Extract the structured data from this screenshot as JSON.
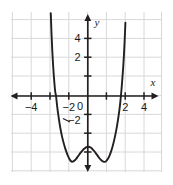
{
  "figure": {
    "background_color": "#ffffff",
    "plot_area": {
      "left": 11,
      "top": 12,
      "right": 162,
      "bottom": 172
    },
    "grid_color": "#d5d5d5",
    "axis_color": "#231f20",
    "curve_color": "#231f20",
    "origin_px": {
      "x": 88,
      "y": 96
    },
    "unit_px": 18.8
  },
  "labels": {
    "x_axis_name": "x",
    "y_axis_name": "y",
    "origin_label": "0"
  },
  "chart_data": {
    "type": "line",
    "title": "",
    "xlabel": "x",
    "ylabel": "y",
    "grid": true,
    "legend": "none",
    "xlim": [
      -5,
      4
    ],
    "ylim": [
      -4.5,
      5
    ],
    "xticks": [
      -4,
      -2,
      2,
      4
    ],
    "xtick_labels": [
      "−4",
      "−2",
      "2",
      "4"
    ],
    "yticks": [
      2,
      4,
      -2
    ],
    "ytick_labels": [
      "2",
      "4",
      "−2"
    ],
    "x_minor_tick_step": 1,
    "y_minor_tick_step": 1,
    "roots": [
      -1.7,
      1.75
    ],
    "minima": [
      {
        "x": -0.85,
        "y": -3.5
      },
      {
        "x": 0.9,
        "y": -3.5
      }
    ],
    "local_maximum": {
      "x": 0.02,
      "y": -2.7
    },
    "series": [
      {
        "name": "quartic",
        "points": [
          [
            -2.02,
            5.6
          ],
          [
            -1.98,
            4.4
          ],
          [
            -1.94,
            3.3
          ],
          [
            -1.9,
            2.4
          ],
          [
            -1.86,
            1.7
          ],
          [
            -1.82,
            1.1
          ],
          [
            -1.78,
            0.6
          ],
          [
            -1.74,
            0.2
          ],
          [
            -1.7,
            0.0
          ],
          [
            -1.64,
            -0.55
          ],
          [
            -1.58,
            -1.0
          ],
          [
            -1.52,
            -1.42
          ],
          [
            -1.45,
            -1.82
          ],
          [
            -1.38,
            -2.16
          ],
          [
            -1.3,
            -2.48
          ],
          [
            -1.22,
            -2.76
          ],
          [
            -1.14,
            -3.0
          ],
          [
            -1.06,
            -3.2
          ],
          [
            -0.98,
            -3.36
          ],
          [
            -0.9,
            -3.47
          ],
          [
            -0.85,
            -3.5
          ],
          [
            -0.78,
            -3.48
          ],
          [
            -0.7,
            -3.42
          ],
          [
            -0.62,
            -3.33
          ],
          [
            -0.54,
            -3.22
          ],
          [
            -0.46,
            -3.11
          ],
          [
            -0.38,
            -3.0
          ],
          [
            -0.3,
            -2.9
          ],
          [
            -0.22,
            -2.82
          ],
          [
            -0.14,
            -2.76
          ],
          [
            -0.06,
            -2.71
          ],
          [
            0.02,
            -2.7
          ],
          [
            0.1,
            -2.72
          ],
          [
            0.18,
            -2.77
          ],
          [
            0.26,
            -2.85
          ],
          [
            0.34,
            -2.94
          ],
          [
            0.42,
            -3.05
          ],
          [
            0.5,
            -3.16
          ],
          [
            0.58,
            -3.27
          ],
          [
            0.66,
            -3.37
          ],
          [
            0.74,
            -3.44
          ],
          [
            0.82,
            -3.49
          ],
          [
            0.9,
            -3.5
          ],
          [
            0.98,
            -3.45
          ],
          [
            1.06,
            -3.34
          ],
          [
            1.14,
            -3.18
          ],
          [
            1.22,
            -2.97
          ],
          [
            1.3,
            -2.71
          ],
          [
            1.38,
            -2.4
          ],
          [
            1.45,
            -2.08
          ],
          [
            1.52,
            -1.72
          ],
          [
            1.58,
            -1.36
          ],
          [
            1.64,
            -0.96
          ],
          [
            1.7,
            -0.5
          ],
          [
            1.75,
            0.0
          ],
          [
            1.79,
            0.45
          ],
          [
            1.83,
            0.95
          ],
          [
            1.87,
            1.5
          ],
          [
            1.91,
            2.15
          ],
          [
            1.95,
            2.95
          ],
          [
            1.99,
            3.9
          ],
          [
            2.03,
            5.1
          ],
          [
            2.06,
            6.0
          ]
        ]
      }
    ]
  }
}
